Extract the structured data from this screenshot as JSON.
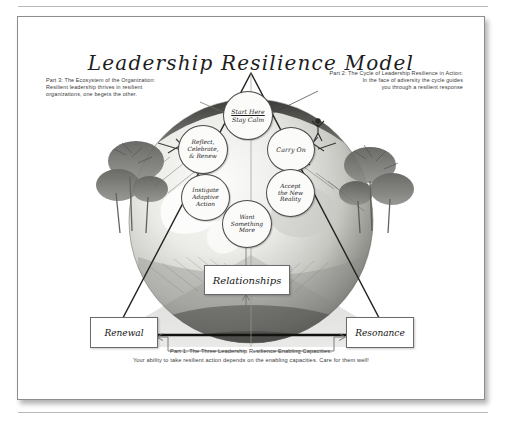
{
  "document": {
    "title": "Leadership Resilience Model"
  },
  "annotations": {
    "part3": {
      "heading": "Part 3: The Ecosystem of the Organization:",
      "line2": "Resilient leadership thrives in resilient",
      "line3": "organizations, one begets the other."
    },
    "part2": {
      "heading": "Part 2: The Cycle of Leadership Resilience in Action:",
      "line2": "In the face of adversity the cycle guides",
      "line3": "you through a resilient response"
    },
    "part1": {
      "heading": "Part 1: The Three Leadership Resilience Enabling Capacities:",
      "line2": "Your ability to take resilient action depends on the enabling capacities. Care for them well!"
    }
  },
  "cycle": {
    "start": {
      "header": "Start Here",
      "label": "Stay Calm"
    },
    "steps": [
      {
        "id": "carry-on",
        "label": "Carry On"
      },
      {
        "id": "accept-new-reality",
        "line1": "Accept",
        "line2": "the New",
        "line3": "Reality"
      },
      {
        "id": "want-something-more",
        "line1": "Want",
        "line2": "Something",
        "line3": "More"
      },
      {
        "id": "instigate-adaptive-action",
        "line1": "Instigate",
        "line2": "Adaptive",
        "line3": "Action"
      },
      {
        "id": "reflect-celebrate-renew",
        "line1": "Reflect,",
        "line2": "Celebrate,",
        "line3": "& Renew"
      }
    ]
  },
  "capacities": {
    "apex": "Relationships",
    "left": "Renewal",
    "right": "Resonance"
  },
  "colors": {
    "ink": "#1c1c1c",
    "annotation_text": "#3a3a3a",
    "card_border": "#8d8d8d",
    "triangle_stroke": "#2b2b2b",
    "bubble_fill": "#fbfbfa",
    "globe_dark": "#4a4a4a",
    "globe_light": "#e9e9e7",
    "page_background": "#ffffff"
  }
}
